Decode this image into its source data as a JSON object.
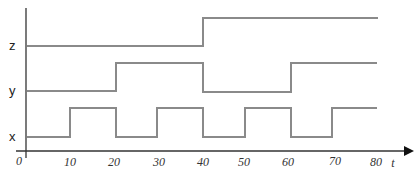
{
  "diagram": {
    "type": "timing-diagram",
    "axis": {
      "label": "t",
      "origin": "0",
      "ticks": [
        "10",
        "20",
        "30",
        "40",
        "50",
        "60",
        "70",
        "80"
      ]
    },
    "signals": [
      {
        "name": "z",
        "transitions": [
          [
            0,
            0
          ],
          [
            40,
            1
          ],
          [
            80,
            1
          ]
        ]
      },
      {
        "name": "y",
        "transitions": [
          [
            0,
            0
          ],
          [
            20,
            1
          ],
          [
            40,
            0
          ],
          [
            60,
            1
          ],
          [
            80,
            1
          ]
        ]
      },
      {
        "name": "x",
        "transitions": [
          [
            0,
            0
          ],
          [
            10,
            1
          ],
          [
            20,
            0
          ],
          [
            30,
            1
          ],
          [
            40,
            0
          ],
          [
            50,
            1
          ],
          [
            60,
            0
          ],
          [
            70,
            1
          ],
          [
            80,
            1
          ]
        ]
      }
    ],
    "colors": {
      "signal": "#8a8a8a",
      "axis": "#222222"
    }
  }
}
